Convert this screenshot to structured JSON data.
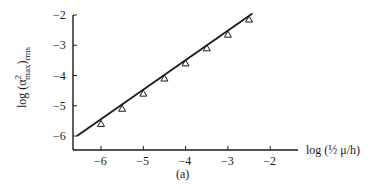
{
  "chart_data": {
    "type": "scatter",
    "title": "",
    "caption": "(a)",
    "xlabel": "log (½ μ/h)",
    "ylabel": "log (α²max)rms",
    "ylabel_parts": {
      "prefix": "log (α",
      "sup": "2",
      "sub": "max",
      "close": ")",
      "outer_sub": "rms"
    },
    "xlim": [
      -6.66,
      -1.4
    ],
    "ylim": [
      -6.45,
      -1.9
    ],
    "x_ticks": [
      -6,
      -5,
      -4,
      -3,
      -2
    ],
    "x_tick_labels": [
      "−6",
      "−5",
      "−4",
      "−3",
      "−2"
    ],
    "y_ticks": [
      -2,
      -3,
      -4,
      -5,
      -6
    ],
    "y_tick_labels": [
      "−2",
      "−3",
      "−4",
      "−5",
      "−6"
    ],
    "grid": false,
    "legend": null,
    "series": [
      {
        "name": "measured",
        "marker": "triangle-open",
        "x": [
          -6.0,
          -5.5,
          -5.0,
          -4.5,
          -4.0,
          -3.5,
          -3.0,
          -2.5
        ],
        "y": [
          -5.6,
          -5.1,
          -4.6,
          -4.1,
          -3.6,
          -3.1,
          -2.65,
          -2.15
        ]
      },
      {
        "name": "fit-line",
        "style": "solid-line",
        "x": [
          -6.57,
          -2.42
        ],
        "y": [
          -6.0,
          -1.95
        ]
      }
    ]
  },
  "colors": {
    "ink": "#1a1a1a",
    "background": "#ffffff"
  }
}
